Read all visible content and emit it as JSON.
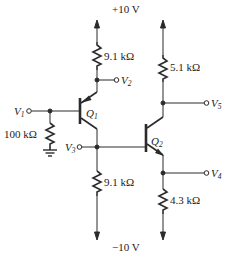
{
  "diagram": {
    "type": "bjt-amplifier-circuit",
    "colors": {
      "wire": "#2b2b2b",
      "background": "#ffffff",
      "text": "#222222"
    },
    "supplies": {
      "positive": "+10 V",
      "negative": "−10 V"
    },
    "transistors": [
      {
        "id": "Q1",
        "label": "Q",
        "sub": "1",
        "kind": "PNP"
      },
      {
        "id": "Q2",
        "label": "Q",
        "sub": "2",
        "kind": "NPN"
      }
    ],
    "resistors": [
      {
        "id": "R_Q1_top",
        "value": "9.1 kΩ"
      },
      {
        "id": "R_base",
        "value": "100 kΩ"
      },
      {
        "id": "R_Q1_bottom",
        "value": "9.1 kΩ"
      },
      {
        "id": "R_Q2_top",
        "value": "5.1 kΩ"
      },
      {
        "id": "R_Q2_bottom",
        "value": "4.3 kΩ"
      }
    ],
    "nodes": [
      {
        "id": "V1",
        "label": "V",
        "sub": "1"
      },
      {
        "id": "V2",
        "label": "V",
        "sub": "2"
      },
      {
        "id": "V3",
        "label": "V",
        "sub": "3"
      },
      {
        "id": "V4",
        "label": "V",
        "sub": "4"
      },
      {
        "id": "V5",
        "label": "V",
        "sub": "5"
      }
    ]
  }
}
